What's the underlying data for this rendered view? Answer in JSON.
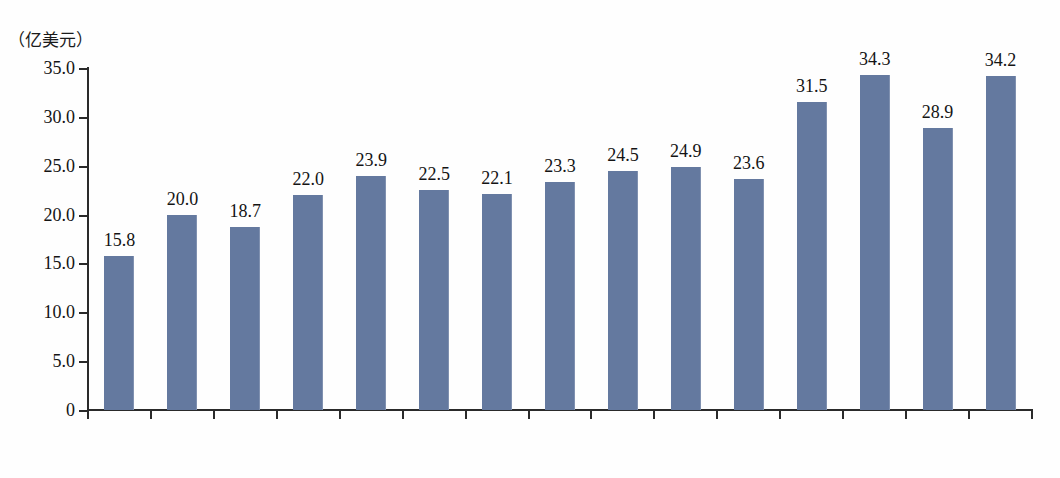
{
  "chart_data": {
    "type": "bar",
    "title": "",
    "subtitle": "",
    "xlabel": "",
    "ylabel": "（亿美元）",
    "unit_label": "（亿美元）",
    "ylim": [
      0,
      35
    ],
    "ytick_labels": [
      "0",
      "5.0",
      "10.0",
      "15.0",
      "20.0",
      "25.0",
      "30.0",
      "35.0"
    ],
    "ytick_values": [
      0,
      5,
      10,
      15,
      20,
      25,
      30,
      35
    ],
    "grid": false,
    "legend": null,
    "series_color": "#64799f",
    "categories": [
      "2010年",
      "2011年",
      "2012年",
      "2013年",
      "2014年",
      "2015年",
      "2016年",
      "2017年",
      "2018年",
      "2019年",
      "2020年",
      "2021年",
      "2022年",
      "2023年",
      "2024年"
    ],
    "values": [
      15.8,
      20.0,
      18.7,
      22.0,
      23.9,
      22.5,
      22.1,
      23.3,
      24.5,
      24.9,
      23.6,
      31.5,
      34.3,
      28.9,
      34.2
    ],
    "data_labels": [
      "15.8",
      "20.0",
      "18.7",
      "22.0",
      "23.9",
      "22.5",
      "22.1",
      "23.3",
      "24.5",
      "24.9",
      "23.6",
      "31.5",
      "34.3",
      "28.9",
      "34.2"
    ]
  }
}
